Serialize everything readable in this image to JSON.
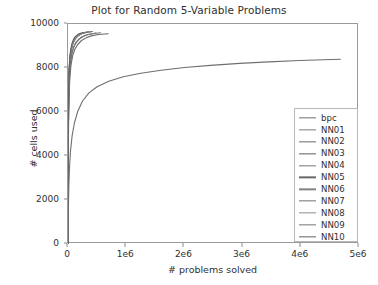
{
  "chart_data": {
    "type": "line",
    "title": "Plot for Random 5-Variable Problems",
    "xlabel": "# problems solved",
    "ylabel": "# cells used",
    "xlim": [
      0,
      5000000
    ],
    "ylim": [
      0,
      10000
    ],
    "xticks": [
      0,
      1000000,
      2000000,
      3000000,
      4000000,
      5000000
    ],
    "xticklabels": [
      "0",
      "1e6",
      "2e6",
      "3e6",
      "4e6",
      "5e6"
    ],
    "yticks": [
      0,
      2000,
      4000,
      6000,
      8000,
      10000
    ],
    "yticklabels": [
      "0",
      "2000",
      "4000",
      "6000",
      "8000",
      "10000"
    ],
    "grid": false,
    "legend_position": "lower right",
    "series": [
      {
        "name": "bpc",
        "color": "#6e6e6e",
        "x_end": 4680000,
        "y_end": 8400,
        "points": [
          [
            0,
            0
          ],
          [
            6000,
            1500
          ],
          [
            14000,
            2600
          ],
          [
            26000,
            3500
          ],
          [
            42000,
            4200
          ],
          [
            70000,
            4900
          ],
          [
            110000,
            5500
          ],
          [
            170000,
            6050
          ],
          [
            250000,
            6500
          ],
          [
            360000,
            6870
          ],
          [
            500000,
            7150
          ],
          [
            700000,
            7400
          ],
          [
            950000,
            7600
          ],
          [
            1250000,
            7760
          ],
          [
            1600000,
            7900
          ],
          [
            2000000,
            8020
          ],
          [
            2450000,
            8120
          ],
          [
            2950000,
            8210
          ],
          [
            3450000,
            8280
          ],
          [
            3980000,
            8340
          ],
          [
            4680000,
            8400
          ]
        ]
      },
      {
        "name": "NN01",
        "color": "#7b7b7b",
        "x_end": 352000,
        "y_end": 9640,
        "points": [
          [
            0,
            0
          ],
          [
            1400,
            2400
          ],
          [
            3200,
            4200
          ],
          [
            6000,
            5700
          ],
          [
            11000,
            6900
          ],
          [
            19000,
            7750
          ],
          [
            31000,
            8350
          ],
          [
            50000,
            8780
          ],
          [
            76000,
            9080
          ],
          [
            110000,
            9290
          ],
          [
            152000,
            9430
          ],
          [
            200000,
            9520
          ],
          [
            252000,
            9580
          ],
          [
            302000,
            9615
          ],
          [
            352000,
            9640
          ]
        ]
      },
      {
        "name": "NN02",
        "color": "#6a6a6a",
        "x_end": 305000,
        "y_end": 9620,
        "points": [
          [
            0,
            0
          ],
          [
            1300,
            2350
          ],
          [
            3000,
            4100
          ],
          [
            5600,
            5600
          ],
          [
            10200,
            6820
          ],
          [
            17500,
            7680
          ],
          [
            28500,
            8290
          ],
          [
            46000,
            8730
          ],
          [
            70000,
            9040
          ],
          [
            101000,
            9260
          ],
          [
            140000,
            9410
          ],
          [
            185000,
            9510
          ],
          [
            235000,
            9570
          ],
          [
            305000,
            9620
          ]
        ]
      },
      {
        "name": "NN03",
        "color": "#5c5c5c",
        "x_end": 420000,
        "y_end": 9660,
        "points": [
          [
            0,
            0
          ],
          [
            1600,
            2450
          ],
          [
            3600,
            4280
          ],
          [
            6800,
            5800
          ],
          [
            12500,
            7000
          ],
          [
            21500,
            7840
          ],
          [
            35000,
            8420
          ],
          [
            56000,
            8840
          ],
          [
            85000,
            9120
          ],
          [
            122000,
            9320
          ],
          [
            168000,
            9450
          ],
          [
            222000,
            9540
          ],
          [
            282000,
            9610
          ],
          [
            420000,
            9660
          ]
        ]
      },
      {
        "name": "NN04",
        "color": "#787878",
        "x_end": 560000,
        "y_end": 9600,
        "points": [
          [
            0,
            0
          ],
          [
            1800,
            2300
          ],
          [
            4200,
            4050
          ],
          [
            8000,
            5550
          ],
          [
            15000,
            6780
          ],
          [
            26000,
            7620
          ],
          [
            42000,
            8220
          ],
          [
            67000,
            8660
          ],
          [
            100000,
            8960
          ],
          [
            145000,
            9180
          ],
          [
            200000,
            9330
          ],
          [
            265000,
            9440
          ],
          [
            340000,
            9520
          ],
          [
            440000,
            9570
          ],
          [
            560000,
            9600
          ]
        ]
      },
      {
        "name": "NN05",
        "color": "#696969",
        "x_end": 690000,
        "y_end": 9560,
        "points": [
          [
            0,
            0
          ],
          [
            2100,
            2200
          ],
          [
            4900,
            3900
          ],
          [
            9300,
            5380
          ],
          [
            17500,
            6620
          ],
          [
            30000,
            7470
          ],
          [
            49000,
            8080
          ],
          [
            78000,
            8540
          ],
          [
            117000,
            8850
          ],
          [
            169000,
            9080
          ],
          [
            233000,
            9250
          ],
          [
            310000,
            9370
          ],
          [
            400000,
            9460
          ],
          [
            520000,
            9520
          ],
          [
            690000,
            9560
          ]
        ]
      },
      {
        "name": "NN06",
        "color": "#828282",
        "x_end": 400000,
        "y_end": 9650,
        "points": [
          [
            0,
            0
          ],
          [
            1500,
            2420
          ],
          [
            3400,
            4230
          ],
          [
            6400,
            5750
          ],
          [
            11800,
            6960
          ],
          [
            20300,
            7800
          ],
          [
            33000,
            8390
          ],
          [
            53000,
            8810
          ],
          [
            80000,
            9100
          ],
          [
            116000,
            9300
          ],
          [
            160000,
            9440
          ],
          [
            212000,
            9530
          ],
          [
            270000,
            9600
          ],
          [
            400000,
            9650
          ]
        ]
      },
      {
        "name": "NN07",
        "color": "#717171",
        "x_end": 332000,
        "y_end": 9630,
        "points": [
          [
            0,
            0
          ],
          [
            1350,
            2380
          ],
          [
            3100,
            4150
          ],
          [
            5800,
            5650
          ],
          [
            10600,
            6870
          ],
          [
            18200,
            7720
          ],
          [
            29600,
            8320
          ],
          [
            47800,
            8760
          ],
          [
            72500,
            9060
          ],
          [
            105000,
            9280
          ],
          [
            145000,
            9420
          ],
          [
            192000,
            9515
          ],
          [
            244000,
            9580
          ],
          [
            332000,
            9630
          ]
        ]
      },
      {
        "name": "NN08",
        "color": "#8c8c8c",
        "x_end": 285000,
        "y_end": 9600,
        "points": [
          [
            0,
            0
          ],
          [
            1250,
            2330
          ],
          [
            2850,
            4080
          ],
          [
            5350,
            5570
          ],
          [
            9800,
            6790
          ],
          [
            16800,
            7650
          ],
          [
            27400,
            8260
          ],
          [
            44200,
            8700
          ],
          [
            67000,
            9010
          ],
          [
            97000,
            9240
          ],
          [
            134000,
            9390
          ],
          [
            178000,
            9490
          ],
          [
            226000,
            9555
          ],
          [
            285000,
            9600
          ]
        ]
      },
      {
        "name": "NN09",
        "color": "#757575",
        "x_end": 480000,
        "y_end": 9590,
        "points": [
          [
            0,
            0
          ],
          [
            1700,
            2270
          ],
          [
            3900,
            4000
          ],
          [
            7400,
            5490
          ],
          [
            13800,
            6720
          ],
          [
            23800,
            7570
          ],
          [
            38600,
            8180
          ],
          [
            62000,
            8620
          ],
          [
            93000,
            8930
          ],
          [
            134000,
            9160
          ],
          [
            185000,
            9310
          ],
          [
            245000,
            9420
          ],
          [
            315000,
            9500
          ],
          [
            480000,
            9590
          ]
        ]
      },
      {
        "name": "NN10",
        "color": "#636363",
        "x_end": 260000,
        "y_end": 9610,
        "points": [
          [
            0,
            0
          ],
          [
            1200,
            2400
          ],
          [
            2750,
            4180
          ],
          [
            5150,
            5680
          ],
          [
            9450,
            6890
          ],
          [
            16200,
            7740
          ],
          [
            26400,
            8340
          ],
          [
            42600,
            8780
          ],
          [
            64500,
            9080
          ],
          [
            93500,
            9300
          ],
          [
            129000,
            9440
          ],
          [
            172000,
            9530
          ],
          [
            216000,
            9580
          ],
          [
            260000,
            9610
          ]
        ]
      }
    ]
  },
  "legend": {
    "entries": [
      {
        "label": "bpc"
      },
      {
        "label": "NN01"
      },
      {
        "label": "NN02"
      },
      {
        "label": "NN03"
      },
      {
        "label": "NN04"
      },
      {
        "label": "NN05"
      },
      {
        "label": "NN06"
      },
      {
        "label": "NN07"
      },
      {
        "label": "NN08"
      },
      {
        "label": "NN09"
      },
      {
        "label": "NN10"
      }
    ]
  }
}
